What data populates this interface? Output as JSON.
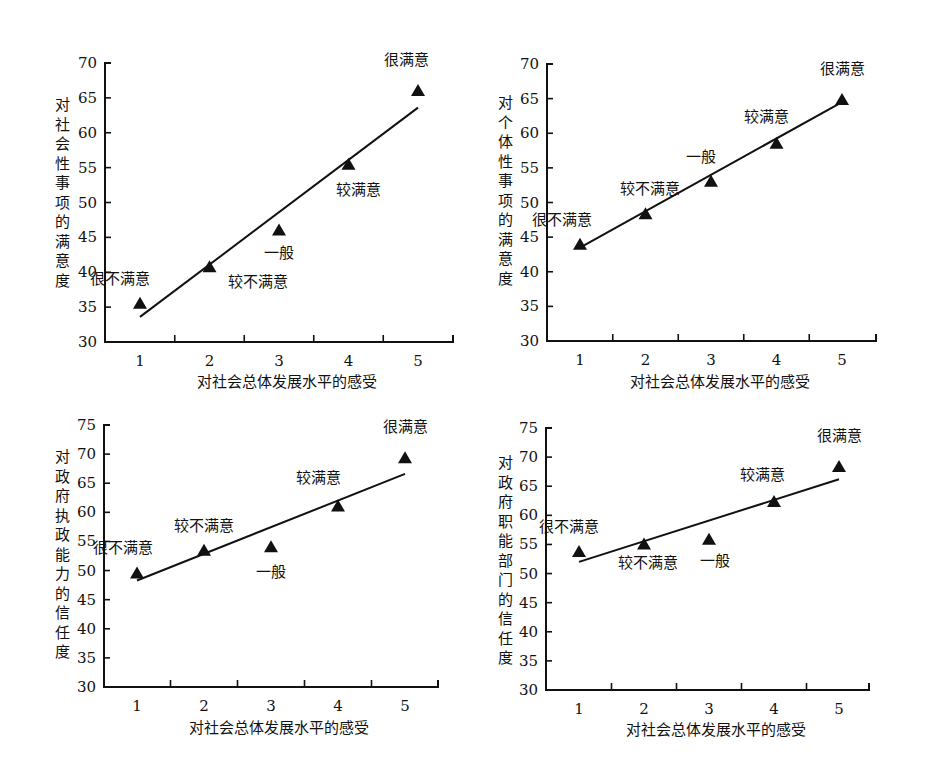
{
  "chart_data": [
    {
      "type": "scatter",
      "title": "",
      "xlabel": "对社会总体发展水平的感受",
      "ylabel": "对社会性事项的满意度",
      "x": [
        1,
        2,
        3,
        4,
        5
      ],
      "xticks": [
        "1",
        "2",
        "3",
        "4",
        "5"
      ],
      "ylim": [
        30,
        70
      ],
      "yticks": [
        30,
        35,
        40,
        45,
        50,
        55,
        60,
        65,
        70
      ],
      "grid": false,
      "legend": "none",
      "series": [
        {
          "name": "points",
          "marker": "triangle",
          "values": [
            35.5,
            40.7,
            46.0,
            55.4,
            66.0
          ],
          "labels": [
            "很不满意",
            "较不满意",
            "一般",
            "较满意",
            "很满意"
          ]
        }
      ],
      "trendline": {
        "x": [
          1,
          5
        ],
        "y": [
          33.6,
          63.6
        ]
      }
    },
    {
      "type": "scatter",
      "title": "",
      "xlabel": "对社会总体发展水平的感受",
      "ylabel": "对个体性事项的满意度",
      "x": [
        1,
        2,
        3,
        4,
        5
      ],
      "xticks": [
        "1",
        "2",
        "3",
        "4",
        "5"
      ],
      "ylim": [
        30,
        70
      ],
      "yticks": [
        30,
        35,
        40,
        45,
        50,
        55,
        60,
        65,
        70
      ],
      "grid": false,
      "legend": "none",
      "series": [
        {
          "name": "points",
          "marker": "triangle",
          "values": [
            43.9,
            48.3,
            53.0,
            58.5,
            64.8
          ],
          "labels": [
            "很不满意",
            "较不满意",
            "一般",
            "较满意",
            "很满意"
          ]
        }
      ],
      "trendline": {
        "x": [
          1,
          5
        ],
        "y": [
          43.5,
          64.5
        ]
      }
    },
    {
      "type": "scatter",
      "title": "",
      "xlabel": "对社会总体发展水平的感受",
      "ylabel": "对政府执政能力的信任度",
      "x": [
        1,
        2,
        3,
        4,
        5
      ],
      "xticks": [
        "1",
        "2",
        "3",
        "4",
        "5"
      ],
      "ylim": [
        30,
        75
      ],
      "yticks": [
        30,
        35,
        40,
        45,
        50,
        55,
        60,
        65,
        70,
        75
      ],
      "grid": false,
      "legend": "none",
      "series": [
        {
          "name": "points",
          "marker": "triangle",
          "values": [
            49.5,
            53.4,
            54.0,
            61.0,
            69.3
          ],
          "labels": [
            "很不满意",
            "较不满意",
            "一般",
            "较满意",
            "很满意"
          ]
        }
      ],
      "trendline": {
        "x": [
          1,
          5
        ],
        "y": [
          48.3,
          66.6
        ]
      }
    },
    {
      "type": "scatter",
      "title": "",
      "xlabel": "对社会总体发展水平的感受",
      "ylabel": "对政府职能部门的信任度",
      "x": [
        1,
        2,
        3,
        4,
        5
      ],
      "xticks": [
        "1",
        "2",
        "3",
        "4",
        "5"
      ],
      "ylim": [
        30,
        75
      ],
      "yticks": [
        30,
        35,
        40,
        45,
        50,
        55,
        60,
        65,
        70,
        75
      ],
      "grid": false,
      "legend": "none",
      "series": [
        {
          "name": "points",
          "marker": "triangle",
          "values": [
            53.7,
            55.0,
            55.8,
            62.3,
            68.3
          ],
          "labels": [
            "很不满意",
            "较不满意",
            "一般",
            "较满意",
            "很满意"
          ]
        }
      ],
      "trendline": {
        "x": [
          1,
          5
        ],
        "y": [
          52.0,
          66.2
        ]
      }
    }
  ]
}
